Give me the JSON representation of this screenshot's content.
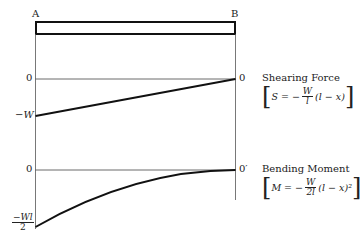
{
  "beam": {
    "left_label": "A",
    "right_label": "B"
  },
  "shear": {
    "title": "Shearing Force",
    "zero_left": "0",
    "zero_right": "0",
    "min_label": "−W",
    "formula": {
      "lhs": "S = −",
      "num": "W",
      "den": "l",
      "rhs": "(l − x)"
    }
  },
  "moment": {
    "title": "Bending Moment",
    "zero_left": "0",
    "zero_right": "0′",
    "min_num": "−Wl",
    "min_den": "2",
    "formula": {
      "lhs": "M = −",
      "num": "W",
      "den": "2l",
      "rhs": "(l − x)²"
    }
  },
  "colors": {
    "line": "#111111",
    "thin": "#444444"
  }
}
